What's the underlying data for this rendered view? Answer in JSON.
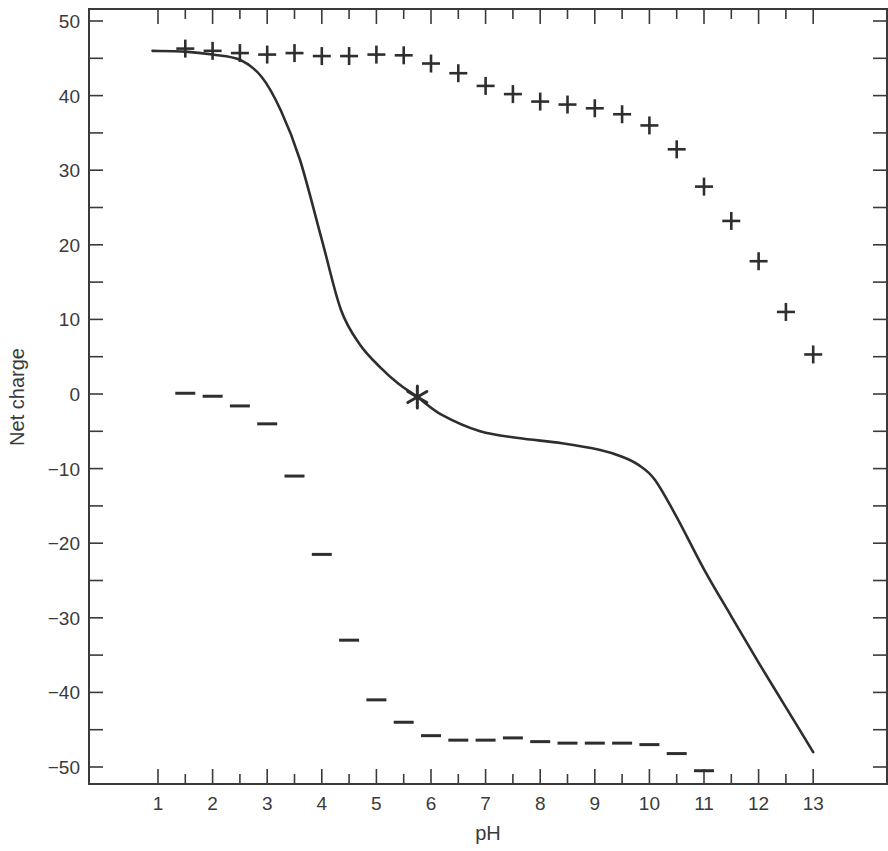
{
  "chart_data": {
    "type": "line",
    "title": "",
    "xlabel": "pH",
    "ylabel": "Net charge",
    "xlim": [
      -0.2,
      14.4
    ],
    "ylim": [
      -52,
      52
    ],
    "grid": false,
    "legend": null,
    "x_ticks": [
      1,
      2,
      3,
      4,
      5,
      6,
      7,
      8,
      9,
      10,
      11,
      12,
      13
    ],
    "x_tick_labels": [
      "1",
      "2",
      "3",
      "4",
      "5",
      "6",
      "7",
      "8",
      "9",
      "10",
      "11",
      "12",
      "13"
    ],
    "y_ticks": [
      50,
      40,
      30,
      20,
      10,
      0,
      -10,
      -20,
      -30,
      -40,
      -50
    ],
    "y_tick_labels": [
      "50",
      "40",
      "30",
      "20",
      "10",
      "0",
      "−10",
      "−20",
      "−30",
      "−40",
      "−50"
    ],
    "series": [
      {
        "name": "Net charge (curve)",
        "style": "solid-line",
        "color": "#2e2e2e",
        "x": [
          0.9,
          1.5,
          2.0,
          2.5,
          2.9,
          3.25,
          3.6,
          4.0,
          4.35,
          4.7,
          5.08,
          5.4,
          5.75,
          6.2,
          6.9,
          7.6,
          8.4,
          9.1,
          9.5,
          9.8,
          10.1,
          10.5,
          11.0,
          11.5,
          12.0,
          12.5,
          13.0
        ],
        "y": [
          46.0,
          45.9,
          45.5,
          44.8,
          42.5,
          38.0,
          31.4,
          20.7,
          11.3,
          6.6,
          3.5,
          1.4,
          -0.4,
          -2.8,
          -5.0,
          -5.9,
          -6.6,
          -7.5,
          -8.4,
          -9.5,
          -11.5,
          -16.5,
          -23.5,
          -29.8,
          -36.0,
          -42.0,
          -48.0
        ]
      },
      {
        "name": "Positive charge",
        "style": "plus-marker",
        "color": "#2e2e2e",
        "x": [
          1.5,
          2.0,
          2.5,
          3.0,
          3.5,
          4.0,
          4.5,
          5.0,
          5.5,
          6.0,
          6.5,
          7.0,
          7.5,
          8.0,
          8.5,
          9.0,
          9.5,
          10.0,
          10.5,
          11.0,
          11.5,
          12.0,
          12.5,
          13.0
        ],
        "y": [
          46.3,
          46.0,
          45.7,
          45.5,
          45.7,
          45.3,
          45.3,
          45.5,
          45.4,
          44.3,
          43.0,
          41.3,
          40.2,
          39.2,
          38.8,
          38.3,
          37.5,
          36.0,
          32.8,
          27.8,
          23.2,
          17.8,
          11.0,
          5.3
        ]
      },
      {
        "name": "Negative charge",
        "style": "minus-marker",
        "color": "#2e2e2e",
        "x": [
          1.5,
          2.0,
          2.5,
          3.0,
          3.5,
          4.0,
          4.5,
          5.0,
          5.5,
          6.0,
          6.5,
          7.0,
          7.5,
          8.0,
          8.5,
          9.0,
          9.5,
          10.0,
          10.5,
          11.0
        ],
        "y": [
          0.1,
          -0.3,
          -1.6,
          -4.0,
          -11.0,
          -21.5,
          -33.0,
          -41.0,
          -44.0,
          -45.8,
          -46.4,
          -46.4,
          -46.1,
          -46.6,
          -46.8,
          -46.8,
          -46.8,
          -47.0,
          -48.2,
          -50.5
        ]
      }
    ],
    "annotations": [
      {
        "type": "asterisk-marker",
        "label": "isoelectric point",
        "x": 5.75,
        "y": -0.4
      }
    ]
  }
}
